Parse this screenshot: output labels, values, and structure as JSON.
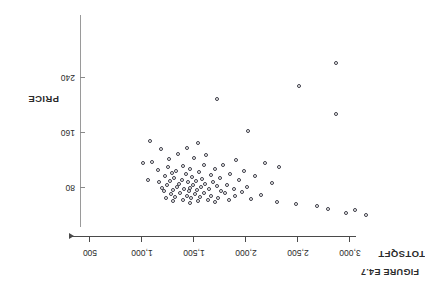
{
  "figure": {
    "caption": "FIGURE E4.7",
    "orientation_degrees": 180
  },
  "axes": {
    "x_axis_title": "TOTSQFT",
    "y_axis_title": "PRICE",
    "x_ticks": [
      "500",
      "1,000",
      "1,500",
      "2,000",
      "2,500",
      "3,000"
    ],
    "y_ticks": [
      "80",
      "160",
      "240"
    ]
  },
  "chart_data": {
    "type": "scatter",
    "title": "FIGURE E4.7",
    "xlabel": "TOTSQFT",
    "ylabel": "PRICE",
    "xlim": [
      400,
      3300
    ],
    "ylim": [
      0,
      300
    ],
    "grid": false,
    "legend": "none",
    "marker": "open-circle",
    "x_ticks": [
      500,
      1000,
      1500,
      2000,
      2500,
      3000
    ],
    "y_ticks": [
      80,
      160,
      240
    ],
    "points": [
      [
        2870,
        262
      ],
      [
        2510,
        229
      ],
      [
        1720,
        210
      ],
      [
        2870,
        188
      ],
      [
        2020,
        163
      ],
      [
        1080,
        148
      ],
      [
        1540,
        145
      ],
      [
        1430,
        138
      ],
      [
        1180,
        136
      ],
      [
        1350,
        130
      ],
      [
        1620,
        128
      ],
      [
        1500,
        124
      ],
      [
        1260,
        122
      ],
      [
        1900,
        120
      ],
      [
        1100,
        118
      ],
      [
        2180,
        117
      ],
      [
        1010,
        116
      ],
      [
        1780,
        114
      ],
      [
        1600,
        113
      ],
      [
        1390,
        112
      ],
      [
        1250,
        111
      ],
      [
        2320,
        110
      ],
      [
        1460,
        108
      ],
      [
        1700,
        107
      ],
      [
        1150,
        106
      ],
      [
        1330,
        105
      ],
      [
        1980,
        104
      ],
      [
        1550,
        103
      ],
      [
        1290,
        102
      ],
      [
        1850,
        101
      ],
      [
        1420,
        100
      ],
      [
        1660,
        99
      ],
      [
        1220,
        98
      ],
      [
        2090,
        97
      ],
      [
        1480,
        96
      ],
      [
        1310,
        95
      ],
      [
        1750,
        94
      ],
      [
        1580,
        93
      ],
      [
        1380,
        92
      ],
      [
        1060,
        92
      ],
      [
        1930,
        91
      ],
      [
        1520,
        90
      ],
      [
        1270,
        90
      ],
      [
        1680,
        89
      ],
      [
        1440,
        88
      ],
      [
        1160,
        88
      ],
      [
        2250,
        87
      ],
      [
        1610,
        86
      ],
      [
        1360,
        86
      ],
      [
        1820,
        85
      ],
      [
        1490,
        84
      ],
      [
        1240,
        84
      ],
      [
        1720,
        83
      ],
      [
        1570,
        82
      ],
      [
        1340,
        82
      ],
      [
        2010,
        81
      ],
      [
        1460,
        80
      ],
      [
        1190,
        80
      ],
      [
        1640,
        79
      ],
      [
        1400,
        78
      ],
      [
        1880,
        78
      ],
      [
        1530,
        77
      ],
      [
        1300,
        77
      ],
      [
        1760,
        76
      ],
      [
        1450,
        75
      ],
      [
        1210,
        75
      ],
      [
        1960,
        74
      ],
      [
        1600,
        73
      ],
      [
        1370,
        73
      ],
      [
        1800,
        72
      ],
      [
        1510,
        71
      ],
      [
        1280,
        71
      ],
      [
        2140,
        70
      ],
      [
        1660,
        69
      ],
      [
        1430,
        69
      ],
      [
        1890,
        68
      ],
      [
        1560,
        67
      ],
      [
        1320,
        67
      ],
      [
        1730,
        66
      ],
      [
        1470,
        65
      ],
      [
        1230,
        65
      ],
      [
        2050,
        64
      ],
      [
        1630,
        63
      ],
      [
        1390,
        63
      ],
      [
        1840,
        62
      ],
      [
        1540,
        61
      ],
      [
        1300,
        61
      ],
      [
        1700,
        60
      ],
      [
        2300,
        59
      ],
      [
        1460,
        58
      ],
      [
        2480,
        57
      ],
      [
        2680,
        54
      ],
      [
        2790,
        50
      ],
      [
        3050,
        48
      ],
      [
        2960,
        44
      ],
      [
        3150,
        40
      ]
    ]
  }
}
